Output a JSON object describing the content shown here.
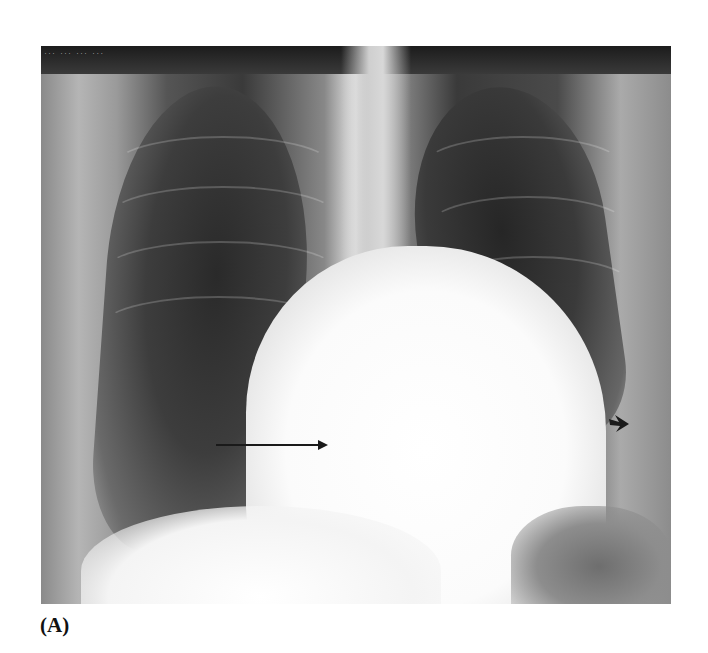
{
  "figure": {
    "panel_label": "(A)",
    "image_description": "Frontal chest radiograph (PA view) showing enlarged cardiac silhouette",
    "film_overlay_text": "... ... ... ...",
    "annotations": [
      {
        "type": "straight-arrow",
        "pointing": "right",
        "color": "#1a1a1a"
      },
      {
        "type": "curved-arrowhead",
        "pointing": "right",
        "color": "#1a1a1a"
      }
    ]
  }
}
